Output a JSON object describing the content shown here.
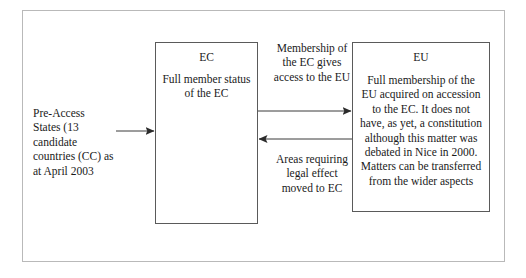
{
  "diagram": {
    "frame": {
      "border_color": "#b9b9b9",
      "background": "#ffffff"
    },
    "line_color": "#3a3a3a",
    "box_border_color": "#5a5a5a",
    "nodes": [
      {
        "id": "pre-access",
        "kind": "text",
        "text": "Pre-Access States (13 candidate countries (CC) as at April 2003"
      },
      {
        "id": "ec",
        "kind": "box",
        "title": "EC",
        "body": "Full member status of the EC"
      },
      {
        "id": "eu",
        "kind": "box",
        "title": "EU",
        "body": "Full membership of the EU acquired on accession to the EC. It does not have, as yet, a constitution although this matter was debated in Nice in 2000. Matters can be transferred from the wider aspects"
      }
    ],
    "edges": [
      {
        "id": "preaccess-to-ec",
        "label": "",
        "direction": "right"
      },
      {
        "id": "ec-to-eu",
        "label": "Membership of the EC gives access to the EU",
        "direction": "right"
      },
      {
        "id": "eu-to-ec",
        "label": "Areas requiring legal effect moved to EC",
        "direction": "left"
      }
    ]
  }
}
